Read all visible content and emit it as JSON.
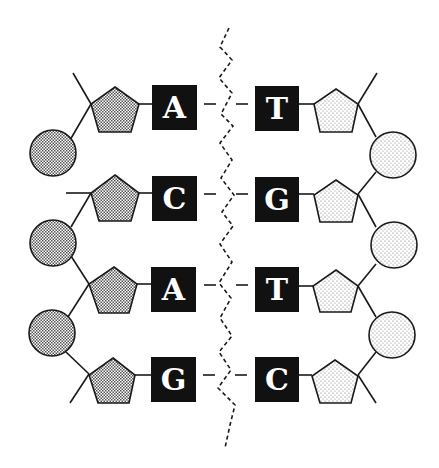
{
  "diagram": {
    "colors": {
      "ink": "#1a1a1a",
      "background": "#ffffff",
      "base_box": "#111111",
      "base_letter": "#ffffff",
      "left_fill": "#bdbdbd",
      "right_fill": "#ececec"
    },
    "left_strand": {
      "bases": [
        "A",
        "C",
        "A",
        "G"
      ],
      "sugar_shape": "pentagon-crosshatched",
      "phosphate_shape": "circle-crosshatched"
    },
    "right_strand": {
      "bases": [
        "T",
        "G",
        "T",
        "C"
      ],
      "sugar_shape": "pentagon-stippled",
      "phosphate_shape": "circle-stippled"
    },
    "pairs": [
      {
        "left": "A",
        "right": "T"
      },
      {
        "left": "C",
        "right": "G"
      },
      {
        "left": "A",
        "right": "T"
      },
      {
        "left": "G",
        "right": "C"
      }
    ],
    "split_line": "dashed-zigzag"
  }
}
